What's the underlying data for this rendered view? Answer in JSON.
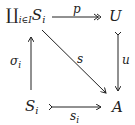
{
  "diagram": {
    "type": "commutative-square",
    "nodes": {
      "top_left": {
        "symbol": "∐",
        "index": "i∈I",
        "object": "S",
        "object_sub": "i"
      },
      "top_right": {
        "object": "U"
      },
      "bottom_left": {
        "object": "S",
        "object_sub": "i"
      },
      "bottom_right": {
        "object": "A"
      }
    },
    "arrows": {
      "top": {
        "label": "p",
        "from": "∐_{i∈I} S_i",
        "to": "U",
        "style": "epimorphism (two-headed)"
      },
      "right": {
        "label": "u",
        "from": "U",
        "to": "A",
        "style": "monomorphism (tailed)"
      },
      "diagonal": {
        "label": "s",
        "from": "∐_{i∈I} S_i",
        "to": "A",
        "style": "plain"
      },
      "left": {
        "label": "σ",
        "label_sub": "i",
        "from": "S_i",
        "to": "∐_{i∈I} S_i",
        "style": "plain"
      },
      "bottom": {
        "label": "s",
        "label_sub": "i",
        "from": "S_i",
        "to": "A",
        "style": "monomorphism (tailed)"
      }
    },
    "colors": {
      "ink": "#222222",
      "background": "#ffffff"
    }
  }
}
